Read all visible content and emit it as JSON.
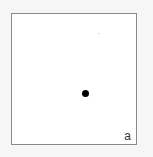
{
  "panel": {
    "label": "a",
    "point": "dot",
    "colors": {
      "background": "#f6f6f6",
      "board": "#ffffff",
      "border": "#8a8a8a",
      "dot": "#000000",
      "label": "#333333"
    }
  }
}
